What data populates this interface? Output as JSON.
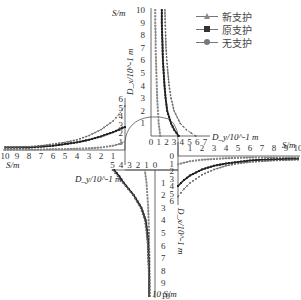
{
  "chart_data": {
    "type": "line",
    "title": "",
    "legend": [
      "新支护",
      "原支护",
      "无支护"
    ],
    "legend_markers": [
      "triangle",
      "square",
      "circle"
    ],
    "panels": [
      {
        "position": "top",
        "xlabel": "D_y/10^-1 m",
        "ylabel": "S/m",
        "x_ticks": [
          "0",
          "1",
          "2",
          "3",
          "4",
          "5",
          "6",
          "7"
        ],
        "y_ticks": [
          "1",
          "2",
          "3",
          "4",
          "5",
          "6",
          "7",
          "8",
          "9",
          "10"
        ],
        "x": [
          0,
          0.5,
          1,
          2,
          3,
          4,
          5,
          6,
          7,
          8,
          9,
          10
        ],
        "series": [
          {
            "name": "新支护",
            "values": [
              1.2,
              1.1,
              1.0,
              0.9,
              0.8,
              0.75,
              0.7,
              0.65,
              0.6,
              0.6,
              0.55,
              0.55
            ]
          },
          {
            "name": "原支护",
            "values": [
              3.6,
              3.0,
              2.6,
              2.1,
              1.9,
              1.75,
              1.65,
              1.55,
              1.5,
              1.45,
              1.4,
              1.4
            ]
          },
          {
            "name": "无支护",
            "values": [
              5.8,
              4.6,
              3.8,
              3.0,
              2.6,
              2.35,
              2.2,
              2.05,
              1.95,
              1.9,
              1.85,
              1.8
            ]
          }
        ]
      },
      {
        "position": "right",
        "xlabel": "S/m",
        "ylabel": "D_x/10^-1 m",
        "x_ticks": [
          "1",
          "2",
          "3",
          "4",
          "5",
          "6",
          "7",
          "8",
          "9",
          "10"
        ],
        "y_ticks": [
          "0",
          "1",
          "2",
          "3",
          "4",
          "5",
          "6"
        ],
        "x": [
          0,
          0.5,
          1,
          2,
          3,
          4,
          5,
          6,
          7,
          8,
          9,
          10
        ],
        "series": [
          {
            "name": "新支护",
            "values": [
              1.1,
              0.9,
              0.7,
              0.5,
              0.4,
              0.3,
              0.25,
              0.2,
              0.2,
              0.2,
              0.2,
              0.2
            ]
          },
          {
            "name": "原支护",
            "values": [
              4.0,
              3.2,
              2.6,
              1.8,
              1.3,
              1.0,
              0.8,
              0.6,
              0.5,
              0.45,
              0.4,
              0.4
            ]
          },
          {
            "name": "无支护",
            "values": [
              5.4,
              4.4,
              3.6,
              2.5,
              1.8,
              1.3,
              1.0,
              0.8,
              0.7,
              0.6,
              0.55,
              0.5
            ]
          }
        ]
      },
      {
        "position": "left",
        "xlabel": "S/m",
        "ylabel": "D_x/10^-1 m",
        "x_ticks": [
          "10",
          "9",
          "8",
          "7",
          "6",
          "5",
          "4",
          "3",
          "2",
          "1"
        ],
        "y_ticks": [
          "1",
          "2",
          "3",
          "4",
          "5",
          "6"
        ],
        "x": [
          0,
          0.5,
          1,
          2,
          3,
          4,
          5,
          6,
          7,
          8,
          9,
          10
        ],
        "series": [
          {
            "name": "新支护",
            "values": [
              1.0,
              0.7,
              0.5,
              0.3,
              0.2,
              0.15,
              0.1,
              0.1,
              0.05,
              0.05,
              0.05,
              0.05
            ]
          },
          {
            "name": "原支护",
            "values": [
              2.7,
              2.4,
              2.1,
              1.6,
              1.2,
              0.9,
              0.7,
              0.5,
              0.4,
              0.3,
              0.3,
              0.3
            ]
          },
          {
            "name": "无支护",
            "values": [
              5.2,
              4.2,
              3.4,
              2.4,
              1.7,
              1.2,
              0.9,
              0.7,
              0.5,
              0.4,
              0.35,
              0.3
            ]
          }
        ]
      },
      {
        "position": "bottom",
        "xlabel": "D_y/10^-1 m",
        "ylabel": "S/m",
        "x_ticks": [
          "5",
          "4",
          "3",
          "2",
          "1",
          "0"
        ],
        "y_ticks": [
          "1",
          "2",
          "3",
          "4",
          "5",
          "6",
          "7",
          "8",
          "9",
          "10"
        ],
        "x": [
          0,
          0.5,
          1,
          2,
          3,
          4,
          5,
          6,
          7,
          8,
          9,
          10
        ],
        "series": [
          {
            "name": "新支护",
            "values": [
              1.2,
              1.1,
              1.0,
              0.9,
              0.8,
              0.75,
              0.7,
              0.7,
              0.65,
              0.65,
              0.6,
              0.6
            ]
          },
          {
            "name": "原支护",
            "values": [
              4.8,
              4.2,
              3.7,
              2.5,
              1.6,
              1.1,
              0.9,
              0.8,
              0.75,
              0.7,
              0.7,
              0.7
            ]
          },
          {
            "name": "无支护",
            "values": [
              5.0,
              4.4,
              3.8,
              2.6,
              1.7,
              1.2,
              1.0,
              0.85,
              0.8,
              0.75,
              0.7,
              0.7
            ]
          }
        ]
      }
    ],
    "grid": false
  },
  "labels": {
    "top_s_axis": "S/m",
    "top_d_axis": "D_y/10^-1 m",
    "right_s_axis": "S/m",
    "right_d_axis": "D_x/10^-1 m",
    "left_s_axis": "S/m",
    "left_d_axis": "D_x/10^-1 m",
    "bottom_s_axis": "10 S/m",
    "bottom_d_axis": "D_y/10^-1 m"
  },
  "legend": {
    "items": [
      {
        "label": "新支护",
        "marker": "triangle"
      },
      {
        "label": "原支护",
        "marker": "square"
      },
      {
        "label": "无支护",
        "marker": "circle"
      }
    ]
  }
}
